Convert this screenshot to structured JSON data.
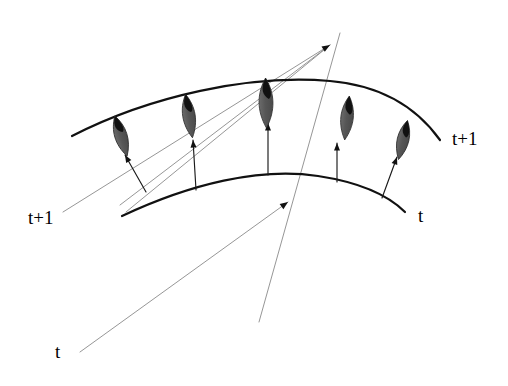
{
  "figure": {
    "background_color": "#ffffff",
    "width": 508,
    "height": 386
  },
  "colors": {
    "curve": "#111111",
    "ray": "#8a8a8a",
    "arrow": "#1a1a1a",
    "leaf_fill": "#5a5a5a",
    "leaf_tip": "#111111",
    "label_text": "#000000"
  },
  "labels": [
    {
      "id": "label-upper-right",
      "text": "t+1",
      "x": 452,
      "y": 129,
      "anchor": "start"
    },
    {
      "id": "label-lower-right",
      "text": "t",
      "x": 418,
      "y": 206,
      "anchor": "start"
    },
    {
      "id": "label-left-middle",
      "text": "t+1",
      "x": 28,
      "y": 208,
      "anchor": "start"
    },
    {
      "id": "label-bottom-left",
      "text": "t",
      "x": 55,
      "y": 342,
      "anchor": "start"
    }
  ],
  "curves": [
    {
      "id": "curve-upper",
      "name": "surface-curve-t-plus-1",
      "label": "t+1",
      "path": "M 72 136 C 150 96 250 74 330 81 C 388 86 420 112 440 140",
      "stroke_width": 2.2
    },
    {
      "id": "curve-lower",
      "name": "surface-curve-t",
      "label": "t",
      "path": "M 122 216 C 190 184 260 167 318 176 C 364 183 390 197 405 212",
      "stroke_width": 2.2
    }
  ],
  "rays": [
    {
      "id": "ray-1",
      "x1": 63,
      "y1": 212,
      "x2": 330,
      "y2": 45
    },
    {
      "id": "ray-2",
      "x1": 120,
      "y1": 205,
      "x2": 330,
      "y2": 45
    },
    {
      "id": "ray-3",
      "x1": 126,
      "y1": 212,
      "x2": 330,
      "y2": 45
    },
    {
      "id": "ray-4",
      "x1": 80,
      "y1": 352,
      "x2": 288,
      "y2": 202
    },
    {
      "id": "ray-5-steep",
      "x1": 259,
      "y1": 322,
      "x2": 340,
      "y2": 33
    }
  ],
  "ray_arrowheads": [
    {
      "id": "ray-head-converge",
      "x": 330,
      "y": 45,
      "angle": -31
    },
    {
      "id": "ray-head-mid",
      "x": 288,
      "y": 202,
      "angle": -36
    }
  ],
  "normal_arrows": [
    {
      "id": "arrow-1",
      "x1": 146,
      "y1": 192,
      "x2": 125,
      "y2": 155,
      "head_angle": -120
    },
    {
      "id": "arrow-2",
      "x1": 196,
      "y1": 190,
      "x2": 193,
      "y2": 140,
      "head_angle": -94
    },
    {
      "id": "arrow-3",
      "x1": 268,
      "y1": 175,
      "x2": 268,
      "y2": 123,
      "head_angle": -90
    },
    {
      "id": "arrow-4",
      "x1": 337,
      "y1": 182,
      "x2": 337,
      "y2": 143,
      "head_angle": -90
    },
    {
      "id": "arrow-5",
      "x1": 382,
      "y1": 198,
      "x2": 397,
      "y2": 157,
      "head_angle": -70
    }
  ],
  "leaves": [
    {
      "id": "leaf-1",
      "name": "normal-marker-1",
      "cx": 121,
      "cy": 136,
      "rx": 8.5,
      "ry": 21,
      "rotate": -17
    },
    {
      "id": "leaf-2",
      "name": "normal-marker-2",
      "cx": 189,
      "cy": 116,
      "rx": 8.5,
      "ry": 22,
      "rotate": -9
    },
    {
      "id": "leaf-3",
      "name": "normal-marker-3",
      "cx": 266,
      "cy": 103,
      "rx": 9.5,
      "ry": 25,
      "rotate": -1
    },
    {
      "id": "leaf-4",
      "name": "normal-marker-4",
      "cx": 347,
      "cy": 118,
      "rx": 8.5,
      "ry": 22,
      "rotate": 6
    },
    {
      "id": "leaf-5",
      "name": "normal-marker-5",
      "cx": 403,
      "cy": 140,
      "rx": 8.0,
      "ry": 20,
      "rotate": 13
    }
  ]
}
